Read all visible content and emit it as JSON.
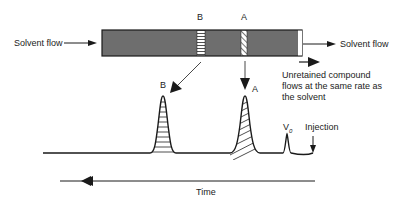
{
  "diagram": {
    "labels": {
      "solvent_flow_in": "Solvent flow",
      "solvent_flow_out": "Solvent flow",
      "band_b": "B",
      "band_a": "A",
      "peak_b": "B",
      "peak_a": "A",
      "v0": "V",
      "v0_sub": "0",
      "injection": "Injection",
      "unretained_line1": "Unretained compound",
      "unretained_line2": "flows at the same rate as",
      "unretained_line3": "the solvent",
      "time": "Time"
    },
    "colors": {
      "column_fill": "#6e6e6e",
      "line": "#1a1a1a"
    }
  }
}
